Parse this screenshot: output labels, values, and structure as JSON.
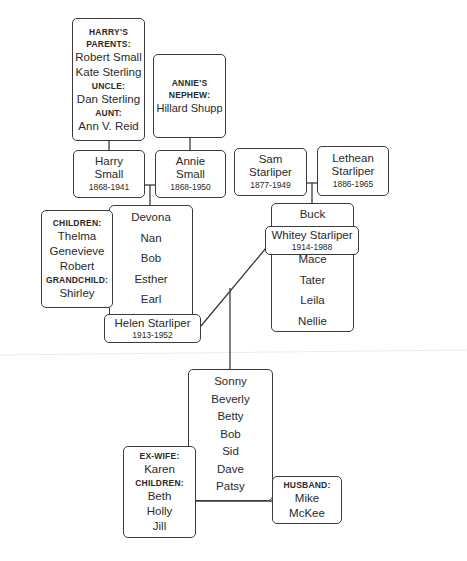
{
  "harrys_relatives": {
    "label_parents": "HARRY'S PARENTS:",
    "parents": [
      "Robert Small",
      "Kate Sterling"
    ],
    "label_uncle": "UNCLE:",
    "uncle": "Dan Sterling",
    "label_aunt": "AUNT:",
    "aunt": "Ann V. Reid"
  },
  "annies_relatives": {
    "label_nephew": "ANNIE'S NEPHEW:",
    "nephew": "Hillard Shupp"
  },
  "couple_small": {
    "husband": {
      "first": "Harry",
      "last": "Small",
      "years": "1868-1941"
    },
    "wife": {
      "first": "Annie",
      "last": "Small",
      "years": "1868-1950"
    }
  },
  "couple_starliper": {
    "husband": {
      "first": "Sam",
      "last": "Starliper",
      "years": "1877-1949"
    },
    "wife": {
      "first": "Lethean",
      "last": "Starliper",
      "years": "1886-1965"
    }
  },
  "small_children": [
    "Devona",
    "Nan",
    "Bob",
    "Esther",
    "Earl",
    "Harry"
  ],
  "devona_family": {
    "label_children": "CHILDREN:",
    "children": [
      "Thelma",
      "Genevieve",
      "Robert"
    ],
    "label_grandchild": "GRANDCHILD:",
    "grandchild": "Shirley"
  },
  "helen": {
    "name": "Helen Starliper",
    "years": "1913-1952"
  },
  "starliper_children_top": [
    "Buck"
  ],
  "whitey": {
    "name": "Whitey Starliper",
    "years": "1914-1988"
  },
  "starliper_children_bottom": [
    "Mace",
    "Tater",
    "Leila",
    "Nellie"
  ],
  "whitey_helen_children": [
    "Sonny",
    "Beverly",
    "Betty",
    "Bob",
    "Sid",
    "Dave",
    "Patsy"
  ],
  "sid_family": {
    "label_exwife": "EX-WIFE:",
    "exwife": "Karen",
    "label_children": "CHILDREN:",
    "children": [
      "Beth",
      "Holly",
      "Jill"
    ]
  },
  "patsy_family": {
    "label_husband": "HUSBAND:",
    "husband_first": "Mike",
    "husband_last": "McKee"
  }
}
